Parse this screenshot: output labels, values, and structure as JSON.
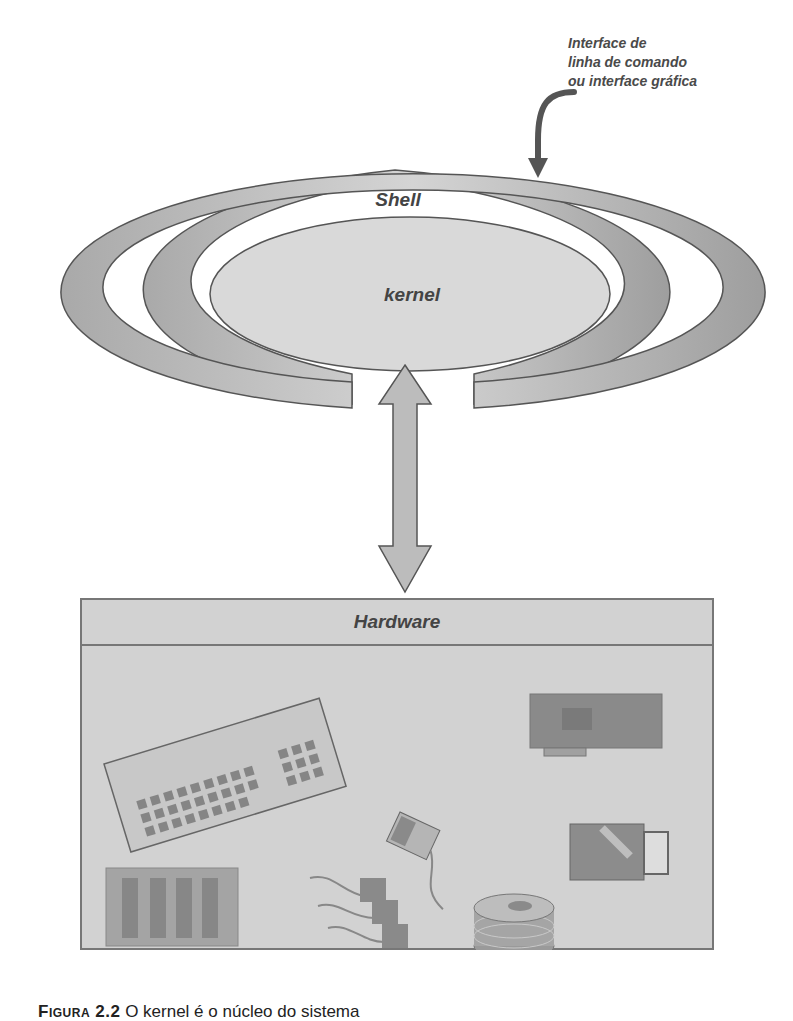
{
  "annotation": {
    "lines": [
      "Interface de",
      "linha de comando",
      "ou interface gráfica"
    ]
  },
  "diagram": {
    "shell_label": "Shell",
    "kernel_label": "kernel",
    "hardware_label": "Hardware",
    "colors": {
      "ring_fill": "#bdbdbd",
      "kernel_fill": "#d9d9d9",
      "hardware_fill": "#d2d2d2",
      "outline": "#555555",
      "device_fill": "#8c8c8c"
    },
    "hardware_items": [
      "keyboard-icon",
      "expansion-card-icon",
      "mouse-icon",
      "drive-icon",
      "memory-module-icon",
      "cables-connectors-icon",
      "disk-stack-icon"
    ]
  },
  "caption": {
    "figure_label": "Figura 2.2",
    "text": "O kernel é o núcleo do sistema"
  }
}
